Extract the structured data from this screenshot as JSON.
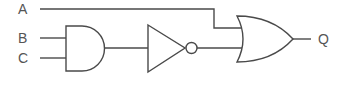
{
  "diagram": {
    "type": "logic-circuit",
    "inputs": [
      {
        "id": "A",
        "label": "A"
      },
      {
        "id": "B",
        "label": "B"
      },
      {
        "id": "C",
        "label": "C"
      }
    ],
    "output": {
      "id": "Q",
      "label": "Q"
    },
    "gates": [
      {
        "id": "and1",
        "type": "AND",
        "inputs": [
          "B",
          "C"
        ]
      },
      {
        "id": "not1",
        "type": "NOT",
        "inputs": [
          "and1"
        ]
      },
      {
        "id": "or1",
        "type": "OR",
        "inputs": [
          "A",
          "not1"
        ]
      }
    ],
    "expression": "Q = A + NOT(B·C)",
    "colors": {
      "stroke": "#4a4a4a",
      "text": "#555555",
      "background": "#ffffff"
    }
  }
}
